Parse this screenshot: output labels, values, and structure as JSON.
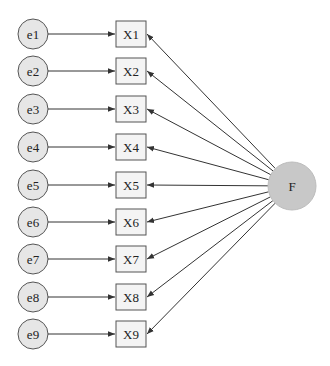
{
  "diagram": {
    "type": "confirmatory-factor-model",
    "factor": {
      "label": "F",
      "cx": 292,
      "cy": 186,
      "r": 24,
      "fill": "#c8c8c8"
    },
    "errors": [
      {
        "label": "e1",
        "cy": 34
      },
      {
        "label": "e2",
        "cy": 71
      },
      {
        "label": "e3",
        "cy": 109
      },
      {
        "label": "e4",
        "cy": 147
      },
      {
        "label": "e5",
        "cy": 185
      },
      {
        "label": "e6",
        "cy": 222
      },
      {
        "label": "e7",
        "cy": 259
      },
      {
        "label": "e8",
        "cy": 297
      },
      {
        "label": "e9",
        "cy": 334
      }
    ],
    "indicators": [
      "X1",
      "X2",
      "X3",
      "X4",
      "X5",
      "X6",
      "X7",
      "X8",
      "X9"
    ],
    "colors": {
      "error_fill": "#e6e6e6",
      "box_fill": "#f4f4f4",
      "stroke": "#555555",
      "arrow": "#333333"
    }
  }
}
